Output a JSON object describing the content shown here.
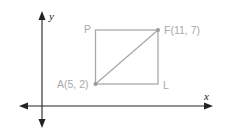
{
  "diagram": {
    "type": "coordinate-plane-rectangle",
    "axes": {
      "x_label": "x",
      "y_label": "y",
      "color": "#222222"
    },
    "shape": {
      "kind": "rectangle",
      "stroke_color": "#a9a9a9",
      "point_color": "#9a9a9a",
      "diagonal": [
        "A",
        "F"
      ]
    },
    "points": {
      "P": {
        "label": "P"
      },
      "F": {
        "label": "F(11, 7)",
        "coords": [
          11,
          7
        ]
      },
      "A": {
        "label": "A(5, 2)",
        "coords": [
          5,
          2
        ]
      },
      "L": {
        "label": "L"
      }
    }
  }
}
